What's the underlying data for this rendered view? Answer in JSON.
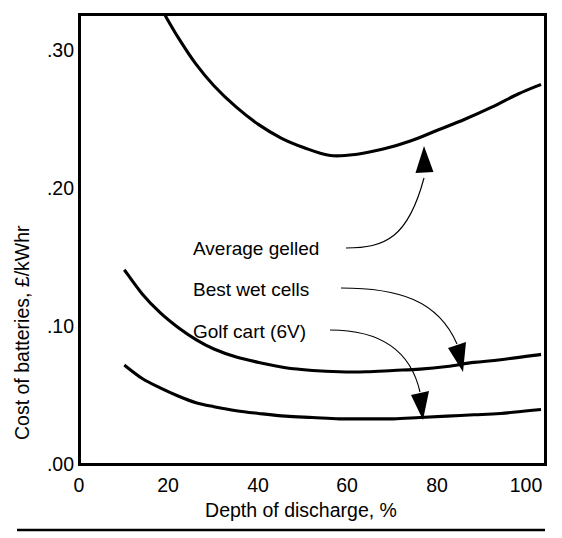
{
  "chart_data": {
    "type": "line",
    "title": "",
    "xlabel": "Depth of discharge, %",
    "ylabel": "Cost of batteries, £/kWhr",
    "xlim": [
      0,
      104
    ],
    "ylim": [
      0.0,
      0.335
    ],
    "xticks": [
      0,
      20,
      40,
      60,
      80,
      100
    ],
    "xtick_labels": [
      "0",
      "20",
      "40",
      "60",
      "80",
      "100"
    ],
    "yticks": [
      0.0,
      0.1,
      0.2,
      0.3
    ],
    "ytick_labels": [
      ".00",
      ".10",
      ".20",
      ".30"
    ],
    "grid": false,
    "legend": "annotated-labels-with-arrows",
    "series": [
      {
        "name": "Average gelled",
        "x": [
          19,
          22,
          26,
          30,
          35,
          40,
          45,
          50,
          56,
          62,
          68,
          74,
          80,
          86,
          92,
          98,
          103
        ],
        "y": [
          0.335,
          0.318,
          0.298,
          0.282,
          0.266,
          0.253,
          0.243,
          0.236,
          0.23,
          0.231,
          0.235,
          0.241,
          0.249,
          0.257,
          0.266,
          0.276,
          0.283
        ]
      },
      {
        "name": "Best wet cells",
        "x": [
          10,
          14,
          18,
          22,
          26,
          30,
          35,
          40,
          46,
          52,
          58,
          64,
          70,
          76,
          82,
          88,
          94,
          103
        ],
        "y": [
          0.145,
          0.127,
          0.113,
          0.102,
          0.093,
          0.086,
          0.08,
          0.076,
          0.072,
          0.07,
          0.069,
          0.069,
          0.07,
          0.071,
          0.073,
          0.076,
          0.078,
          0.082
        ]
      },
      {
        "name": "Golf cart (6V)",
        "x": [
          10,
          14,
          18,
          22,
          26,
          30,
          35,
          40,
          46,
          52,
          58,
          64,
          70,
          76,
          82,
          88,
          94,
          103
        ],
        "y": [
          0.074,
          0.064,
          0.057,
          0.051,
          0.046,
          0.043,
          0.04,
          0.038,
          0.036,
          0.035,
          0.034,
          0.034,
          0.034,
          0.035,
          0.036,
          0.037,
          0.038,
          0.041
        ]
      }
    ],
    "annotations": [
      {
        "label": "Average gelled",
        "points_to_series": "Average gelled",
        "arrow_target_x": 78,
        "arrow_target_y": 0.245,
        "arrow_direction": "up"
      },
      {
        "label": "Best wet cells",
        "points_to_series": "Best wet cells",
        "arrow_target_x": 86,
        "arrow_target_y": 0.085,
        "arrow_direction": "down"
      },
      {
        "label": "Golf cart (6V)",
        "points_to_series": "Golf cart (6V)",
        "arrow_target_x": 75,
        "arrow_target_y": 0.046,
        "arrow_direction": "down"
      }
    ]
  },
  "axes": {
    "y_title": "Cost of batteries, £/kWhr",
    "x_title": "Depth of discharge, %",
    "y_tick_labels": [
      ".30",
      ".20",
      ".10",
      ".00"
    ],
    "x_tick_labels": [
      "0",
      "20",
      "40",
      "60",
      "80",
      "100"
    ]
  },
  "annotation_labels": {
    "average_gelled": "Average gelled",
    "best_wet_cells": "Best wet cells",
    "golf_cart": "Golf cart (6V)"
  },
  "colors": {
    "ink": "#000000",
    "background": "#ffffff"
  }
}
